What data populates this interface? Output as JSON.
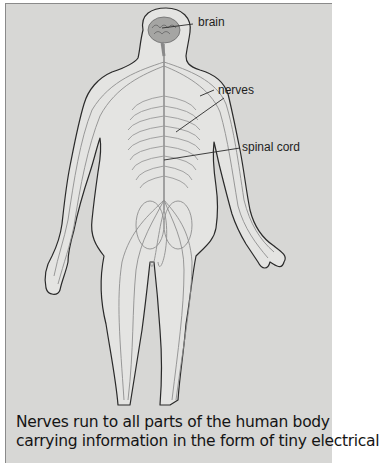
{
  "figure": {
    "labels": {
      "brain": "brain",
      "nerves": "nerves",
      "spinal_cord": "spinal cord"
    },
    "colors": {
      "background": "#d7d7d5",
      "body_fill": "#e4e4e2",
      "outline": "#2a2a2a",
      "nerve": "#8a8a8a",
      "brain": "#9a9a98"
    }
  },
  "caption": {
    "line1": "Nerves run to all parts of the human body",
    "line2": "carrying information in the form of tiny electrical"
  }
}
